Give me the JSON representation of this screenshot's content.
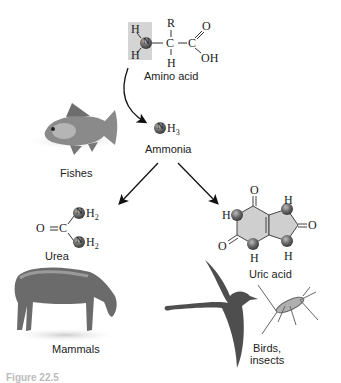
{
  "diagram": {
    "nodes": {
      "amino_acid": {
        "label": "Amino acid",
        "formula": {
          "R": "R",
          "H_top_left": "H",
          "H_bottom_left": "H",
          "N": "N",
          "C_alpha": "C",
          "H_alpha": "H",
          "C_carboxyl": "C",
          "O": "O",
          "OH": "OH"
        }
      },
      "ammonia": {
        "label": "Ammonia",
        "formula": {
          "N": "N",
          "H3": "H",
          "sub": "3"
        }
      },
      "urea": {
        "label": "Urea",
        "formula": {
          "O": "O",
          "C": "C",
          "NH2_top": "H",
          "NH2_bottom": "H",
          "sub": "2",
          "N": "N"
        }
      },
      "uric_acid": {
        "label": "Uric acid",
        "formula": {
          "O_top": "O",
          "O_left": "O",
          "O_right": "O",
          "H": "H",
          "N": "N"
        }
      }
    },
    "organisms": {
      "fishes": "Fishes",
      "mammals": "Mammals",
      "birds_insects_line1": "Birds,",
      "birds_insects_line2": "insects"
    },
    "edges": [
      {
        "from": "amino_acid",
        "to": "ammonia"
      },
      {
        "from": "ammonia",
        "to": "urea"
      },
      {
        "from": "ammonia",
        "to": "uric_acid"
      }
    ],
    "caption": "Figure 22.5",
    "colors": {
      "nitrogen_ball": "#6a6a6a",
      "highlight_box": "#d4d4d4",
      "ring_fill": "#cfcfcf",
      "arrow": "#111111"
    }
  }
}
